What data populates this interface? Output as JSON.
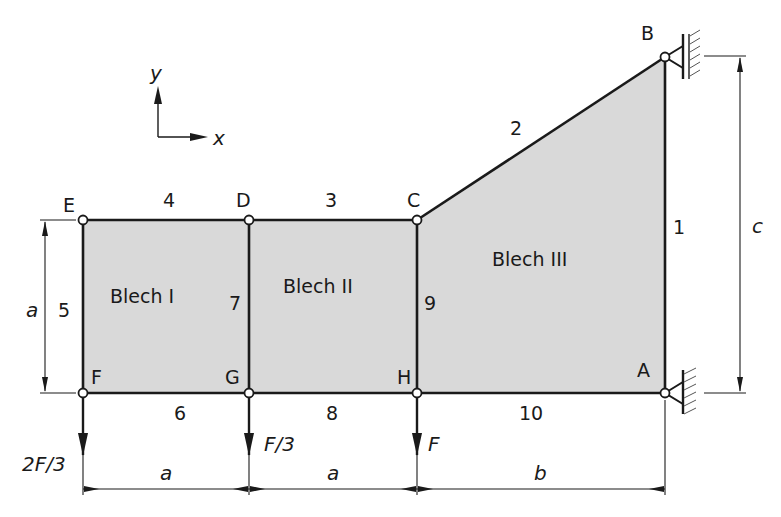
{
  "diagram": {
    "type": "truss with shear plates",
    "nodes": {
      "A": {
        "label": "A"
      },
      "B": {
        "label": "B"
      },
      "C": {
        "label": "C"
      },
      "D": {
        "label": "D"
      },
      "E": {
        "label": "E"
      },
      "F": {
        "label": "F"
      },
      "G": {
        "label": "G"
      },
      "H": {
        "label": "H"
      }
    },
    "members": [
      "1",
      "2",
      "3",
      "4",
      "5",
      "6",
      "7",
      "8",
      "9",
      "10"
    ],
    "plates": {
      "I": "Blech I",
      "II": "Blech II",
      "III": "Blech III"
    },
    "loads": {
      "F": "2F/3",
      "G": "F/3",
      "H": "F"
    },
    "dimensions": {
      "height_left": "a",
      "width_1": "a",
      "width_2": "a",
      "width_3": "b",
      "height_right": "c"
    },
    "axes": {
      "x": "x",
      "y": "y"
    },
    "colors": {
      "plate_fill": "#d9d9d9",
      "line": "#1a1a1a"
    }
  }
}
